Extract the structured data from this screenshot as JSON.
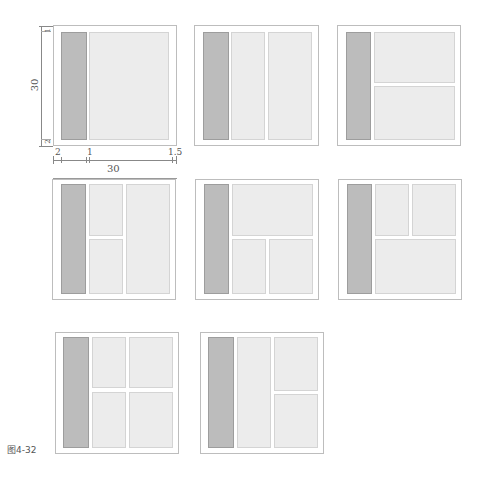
{
  "figure": {
    "caption": "图4-32",
    "colors": {
      "sidebar": "#bcbcbc",
      "content": "#ececec",
      "border": "#bdbdbd"
    }
  },
  "dimensions": {
    "vertical_total": "30",
    "top_margin": "1",
    "bottom_margin": "2",
    "left_margin": "2",
    "gutter": "1",
    "right_margin": "1.5",
    "horizontal_total": "30"
  },
  "layouts": [
    {
      "id": 1,
      "description": "sidebar + single content area"
    },
    {
      "id": 2,
      "description": "sidebar + two equal columns"
    },
    {
      "id": 3,
      "description": "sidebar + two stacked rows"
    },
    {
      "id": 4,
      "description": "sidebar + left column split in two rows + right full column"
    },
    {
      "id": 5,
      "description": "sidebar + top wide row + bottom two cells"
    },
    {
      "id": 6,
      "description": "sidebar + top two cells + bottom wide row"
    },
    {
      "id": 7,
      "description": "sidebar + 2x2 grid"
    },
    {
      "id": 8,
      "description": "sidebar + full left column + right column split in two rows"
    }
  ]
}
